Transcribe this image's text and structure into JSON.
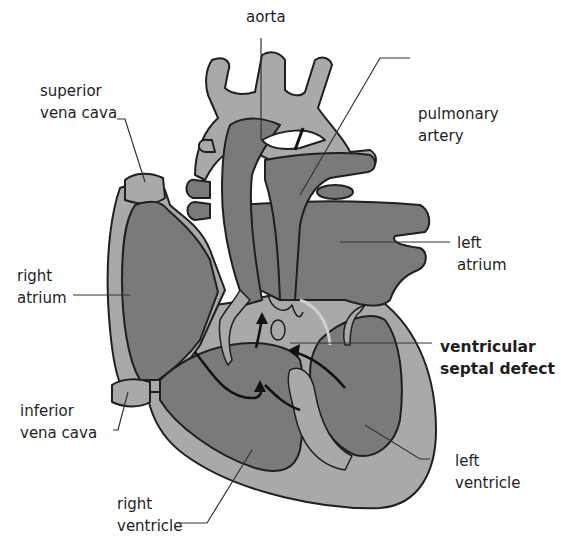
{
  "diagram": {
    "colors": {
      "light_tissue": "#a9a9a9",
      "dark_chamber": "#7a7a7a",
      "outline": "#1f1f1f",
      "background": "#ffffff",
      "leader_line": "#333333"
    },
    "labels": {
      "aorta": {
        "lines": [
          "aorta"
        ]
      },
      "superior_vena_cava": {
        "lines": [
          "superior",
          "vena cava"
        ]
      },
      "pulmonary_artery": {
        "lines": [
          "pulmonary",
          "artery"
        ]
      },
      "left_atrium": {
        "lines": [
          "left",
          "atrium"
        ]
      },
      "right_atrium": {
        "lines": [
          "right",
          "atrium"
        ]
      },
      "ventricular_septal_defect": {
        "lines": [
          "ventricular",
          "septal defect"
        ],
        "emphasis": "bold"
      },
      "inferior_vena_cava": {
        "lines": [
          "inferior",
          "vena cava"
        ]
      },
      "left_ventricle": {
        "lines": [
          "left",
          "ventricle"
        ]
      },
      "right_ventricle": {
        "lines": [
          "right",
          "ventricle"
        ]
      }
    },
    "annotations": {
      "blood_flow_arrows": 4
    }
  }
}
